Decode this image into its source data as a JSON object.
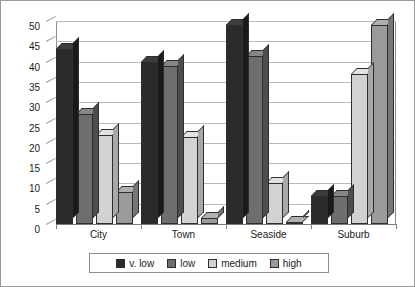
{
  "chart_data": {
    "type": "bar",
    "title": "",
    "subtitle": "",
    "xlabel": "",
    "ylabel": "",
    "categories": [
      "City",
      "Town",
      "Seaside",
      "Suburb"
    ],
    "series": [
      {
        "name": "v. low",
        "values": [
          43,
          40,
          49,
          7
        ],
        "color": "#2b2b2b"
      },
      {
        "name": "low",
        "values": [
          27,
          39,
          41.5,
          7
        ],
        "color": "#6e6e6e"
      },
      {
        "name": "medium",
        "values": [
          22,
          21.5,
          10,
          37
        ],
        "color": "#d2d2d2"
      },
      {
        "name": "high",
        "values": [
          8,
          1.5,
          0.5,
          49
        ],
        "color": "#9a9a9a"
      }
    ],
    "ylim": [
      0,
      50
    ],
    "ytick_step": 5,
    "yticks": [
      "50",
      "45",
      "40",
      "35",
      "30",
      "25",
      "20",
      "15",
      "10",
      "5",
      "0"
    ],
    "grid": true,
    "grid_axis": "y",
    "legend_position": "bottom",
    "style": "3d-column"
  }
}
